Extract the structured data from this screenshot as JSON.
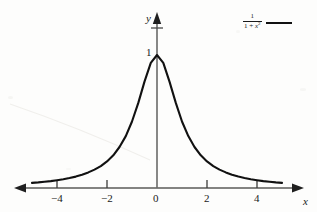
{
  "figure": {
    "background_color": "#fdfdfc",
    "curve_color": "#111111",
    "axis_color": "#4a4a4a",
    "text_color": "#1a1a1a"
  },
  "axes": {
    "x_name": "x",
    "y_name": "y",
    "x_ticks": [
      {
        "value": -4,
        "label": "−4"
      },
      {
        "value": -2,
        "label": "−2"
      },
      {
        "value": 0,
        "label": "0"
      },
      {
        "value": 2,
        "label": "2"
      },
      {
        "value": 4,
        "label": "4"
      }
    ],
    "y_ticks": [
      {
        "value": 1,
        "label": "1"
      }
    ]
  },
  "legend": {
    "entries": [
      {
        "numerator": "1",
        "denominator_prefix": "1 + ",
        "denominator_var": "x",
        "denominator_exponent": "2",
        "formula_text": "1/(1 + x^2)",
        "line_color": "#111111"
      }
    ]
  },
  "chart_data": {
    "type": "line",
    "title": "",
    "xlabel": "x",
    "ylabel": "y",
    "xlim": [
      -5.2,
      5.2
    ],
    "ylim": [
      0,
      1.35
    ],
    "grid": false,
    "legend_position": "top-right",
    "series": [
      {
        "name": "1/(1 + x^2)",
        "equation": "y = 1 / (1 + x^2)",
        "color": "#111111",
        "x": [
          -5.0,
          -4.75,
          -4.5,
          -4.25,
          -4.0,
          -3.75,
          -3.5,
          -3.25,
          -3.0,
          -2.75,
          -2.5,
          -2.25,
          -2.0,
          -1.75,
          -1.5,
          -1.25,
          -1.0,
          -0.75,
          -0.5,
          -0.25,
          0.0,
          0.25,
          0.5,
          0.75,
          1.0,
          1.25,
          1.5,
          1.75,
          2.0,
          2.25,
          2.5,
          2.75,
          3.0,
          3.25,
          3.5,
          3.75,
          4.0,
          4.25,
          4.5,
          4.75,
          5.0
        ],
        "y": [
          0.038,
          0.042,
          0.047,
          0.052,
          0.059,
          0.066,
          0.075,
          0.086,
          0.1,
          0.117,
          0.138,
          0.165,
          0.2,
          0.246,
          0.308,
          0.39,
          0.5,
          0.64,
          0.8,
          0.941,
          1.0,
          0.941,
          0.8,
          0.64,
          0.5,
          0.39,
          0.308,
          0.246,
          0.2,
          0.165,
          0.138,
          0.117,
          0.1,
          0.086,
          0.075,
          0.066,
          0.059,
          0.052,
          0.047,
          0.042,
          0.038
        ]
      }
    ]
  }
}
